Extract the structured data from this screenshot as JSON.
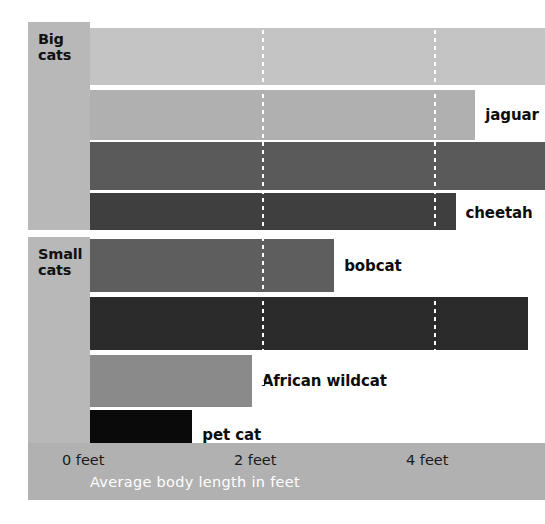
{
  "chart_data": {
    "type": "bar",
    "title": "",
    "orientation": "horizontal",
    "xlabel": "Average body length in feet",
    "ylabel": "",
    "xlim": [
      0,
      5.3
    ],
    "grid": true,
    "gridlines": [
      2,
      4
    ],
    "tick_labels": [
      "0 feet",
      "2 feet",
      "4 feet"
    ],
    "tick_values": [
      0,
      2,
      4
    ],
    "units": "feet",
    "groups": [
      {
        "name": "Big cats",
        "label_lines": [
          "Big",
          "cats"
        ],
        "bars": [
          {
            "label": "",
            "value": 5.35,
            "clipped": true,
            "color": "#c4c4c4"
          },
          {
            "label": "jaguar",
            "value": 4.48,
            "clipped": false,
            "color": "#b0b0b0"
          },
          {
            "label": "",
            "value": 5.35,
            "clipped": true,
            "color": "#5a5a5a"
          },
          {
            "label": "cheetah",
            "value": 4.25,
            "clipped": false,
            "color": "#3f3f3f"
          }
        ]
      },
      {
        "name": "Small cats",
        "label_lines": [
          "Small",
          "cats"
        ],
        "bars": [
          {
            "label": "bobcat",
            "value": 2.84,
            "clipped": false,
            "color": "#5e5e5e"
          },
          {
            "label": "",
            "value": 5.09,
            "clipped": false,
            "color": "#2b2b2b"
          },
          {
            "label": "African wildcat",
            "value": 1.88,
            "clipped": false,
            "color": "#8a8a8a"
          },
          {
            "label": "pet cat",
            "value": 1.19,
            "clipped": false,
            "color": "#0a0a0a"
          }
        ]
      }
    ]
  },
  "colors": {
    "panel_gray": "#b8b8b8",
    "axis_band_gray": "#b1b1b1",
    "plot_background": "#ffffff",
    "gridline": "#ffffff",
    "axis_title_text": "#ffffff",
    "tick_text": "#1a1a1a",
    "label_text": "#0d0d0d"
  },
  "axis": {
    "title": "Average body length in feet",
    "ticks": [
      {
        "label": "0 feet",
        "value": 0
      },
      {
        "label": "2 feet",
        "value": 2
      },
      {
        "label": "4 feet",
        "value": 4
      }
    ]
  },
  "groups_meta": {
    "big": {
      "label_line1": "Big",
      "label_line2": "cats"
    },
    "small": {
      "label_line1": "Small",
      "label_line2": "cats"
    }
  },
  "bar_labels": {
    "jaguar": "jaguar",
    "cheetah": "cheetah",
    "bobcat": "bobcat",
    "african_wildcat": "African wildcat",
    "pet_cat": "pet cat"
  }
}
